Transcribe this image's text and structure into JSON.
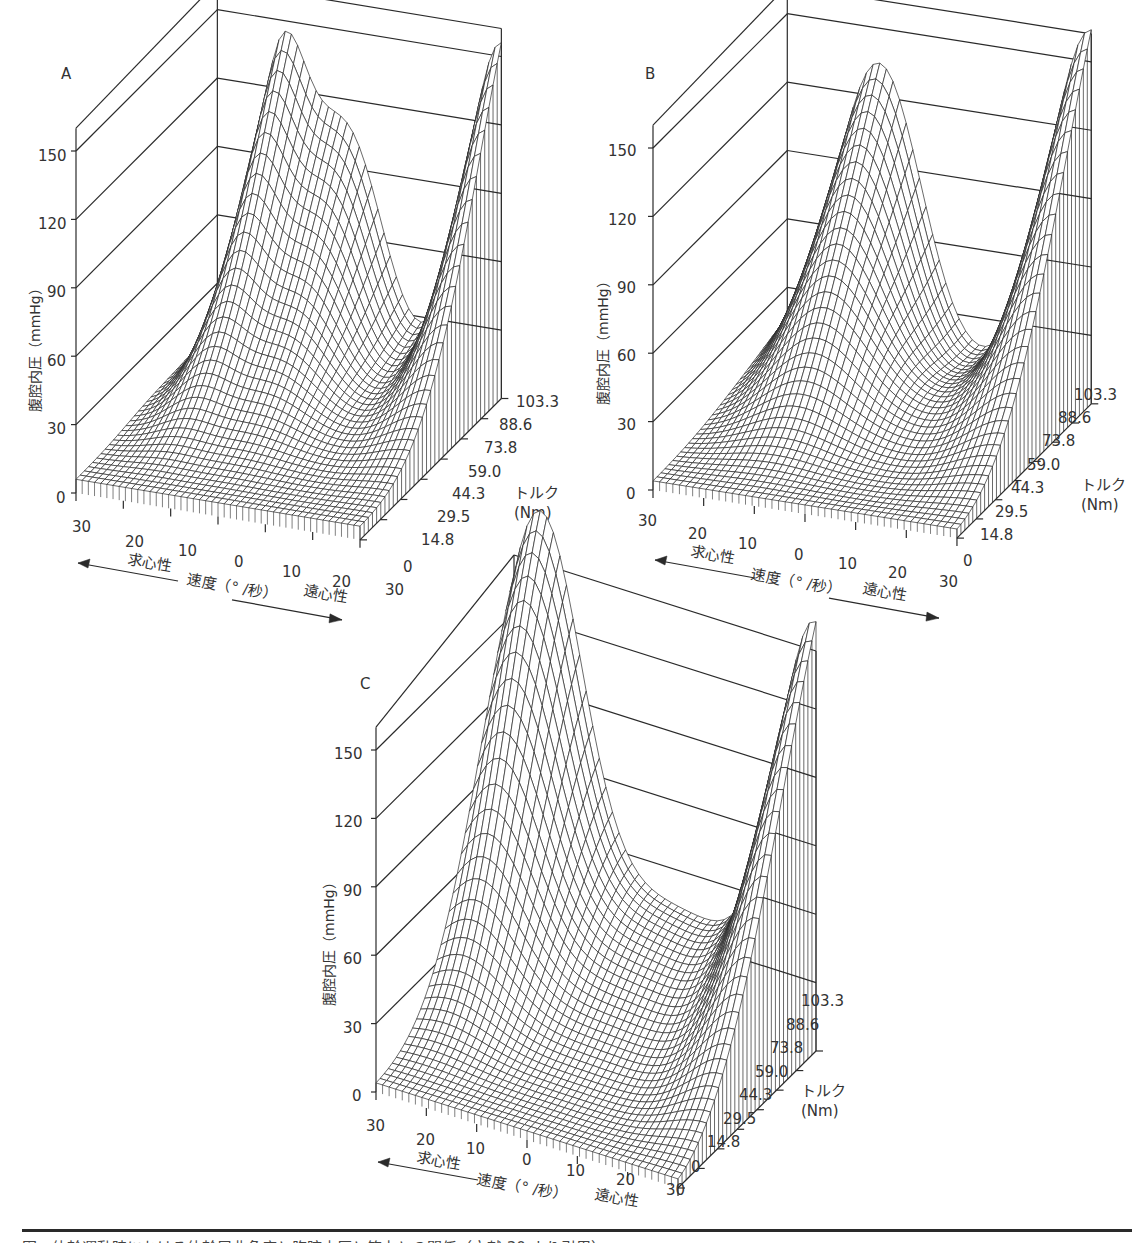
{
  "chart_data": [
    {
      "type": "surface3d",
      "panel": "A",
      "title": "A",
      "zlabel": "腹腔内圧（mmHg）",
      "xlabel": "速度（° /秒）",
      "x_direction_left": "求心性",
      "x_direction_right": "遠心性",
      "ylabel": "トルク\n(Nm)",
      "z_ticks": [
        0,
        30,
        60,
        90,
        120,
        150
      ],
      "x_ticks": [
        "30",
        "20",
        "10",
        "0",
        "10",
        "20",
        "30"
      ],
      "y_ticks": [
        "0",
        "14.8",
        "29.5",
        "44.3",
        "59.0",
        "73.8",
        "88.6",
        "103.3"
      ],
      "zlim": [
        0,
        160
      ],
      "description": "Peak ~125 mmHg at high torque concentric ~20°/s; plateau ~105 mmHg near 0; trough ~80 at eccentric 10; peak ~150 at eccentric 30 high torque"
    },
    {
      "type": "surface3d",
      "panel": "B",
      "title": "B",
      "zlabel": "腹腔内圧（mmHg）",
      "xlabel": "速度（° /秒）",
      "x_direction_left": "求心性",
      "x_direction_right": "遠心性",
      "ylabel": "トルク\n(Nm)",
      "z_ticks": [
        0,
        30,
        60,
        90,
        120,
        150
      ],
      "x_ticks": [
        "30",
        "20",
        "10",
        "0",
        "10",
        "20",
        "30"
      ],
      "y_ticks": [
        "0",
        "14.8",
        "29.5",
        "44.3",
        "59.0",
        "73.8",
        "88.6",
        "103.3"
      ],
      "zlim": [
        0,
        160
      ],
      "description": "Peak ~135 mmHg at high torque concentric 10-20; trough ~70 at eccentric 10; rises to ~160 at eccentric 30 high torque"
    },
    {
      "type": "surface3d",
      "panel": "C",
      "title": "C",
      "zlabel": "腹腔内圧（mmHg）",
      "xlabel": "速度（° /秒）",
      "x_direction_left": "求心性",
      "x_direction_right": "遠心性",
      "ylabel": "トルク\n(Nm)",
      "z_ticks": [
        0,
        30,
        60,
        90,
        120,
        150
      ],
      "x_ticks": [
        "30",
        "20",
        "10",
        "0",
        "10",
        "20",
        "30"
      ],
      "y_ticks": [
        "0",
        "14.8",
        "29.5",
        "44.3",
        "59.0",
        "73.8",
        "88.6",
        "103.3"
      ],
      "zlim": [
        0,
        160
      ],
      "description": "Peak ~170 mmHg at high torque concentric 20-30; valley ~60 at center; rises to ~165 at eccentric 30 high torque"
    }
  ],
  "panels": {
    "A": {
      "letter": "A",
      "zlabel": "腹腔内圧（mmHg）",
      "z_ticks": [
        "0",
        "30",
        "60",
        "90",
        "120",
        "150"
      ],
      "x_ticks": [
        "30",
        "20",
        "10",
        "0",
        "10",
        "20",
        "30"
      ],
      "y_ticks": [
        "0",
        "14.8",
        "29.5",
        "44.3",
        "59.0",
        "73.8",
        "88.6",
        "103.3"
      ],
      "torque_label_1": "トルク",
      "torque_label_2": "(Nm)",
      "concentric": "求心性",
      "eccentric": "遠心性",
      "speed_label": "速度（° /秒）"
    },
    "B": {
      "letter": "B",
      "zlabel": "腹腔内圧（mmHg）",
      "z_ticks": [
        "0",
        "30",
        "60",
        "90",
        "120",
        "150"
      ],
      "x_ticks": [
        "30",
        "20",
        "10",
        "0",
        "10",
        "20",
        "30"
      ],
      "y_ticks": [
        "0",
        "14.8",
        "29.5",
        "44.3",
        "59.0",
        "73.8",
        "88.6",
        "103.3"
      ],
      "torque_label_1": "トルク",
      "torque_label_2": "(Nm)",
      "concentric": "求心性",
      "eccentric": "遠心性",
      "speed_label": "速度（° /秒）"
    },
    "C": {
      "letter": "C",
      "zlabel": "腹腔内圧（mmHg）",
      "z_ticks": [
        "0",
        "30",
        "60",
        "90",
        "120",
        "150"
      ],
      "x_ticks": [
        "30",
        "20",
        "10",
        "0",
        "10",
        "20",
        "30"
      ],
      "y_ticks": [
        "0",
        "14.8",
        "29.5",
        "44.3",
        "59.0",
        "73.8",
        "88.6",
        "103.3"
      ],
      "torque_label_1": "トルク",
      "torque_label_2": "(Nm)",
      "concentric": "求心性",
      "eccentric": "遠心性",
      "speed_label": "速度（° /秒）"
    }
  },
  "caption": "図　体幹運動時における体幹屈曲角度と腹腔内圧と筋力との関係（文献 30 より引用）",
  "colors": {
    "ink": "#2a2a2a",
    "text": "#333333",
    "background": "#ffffff"
  }
}
